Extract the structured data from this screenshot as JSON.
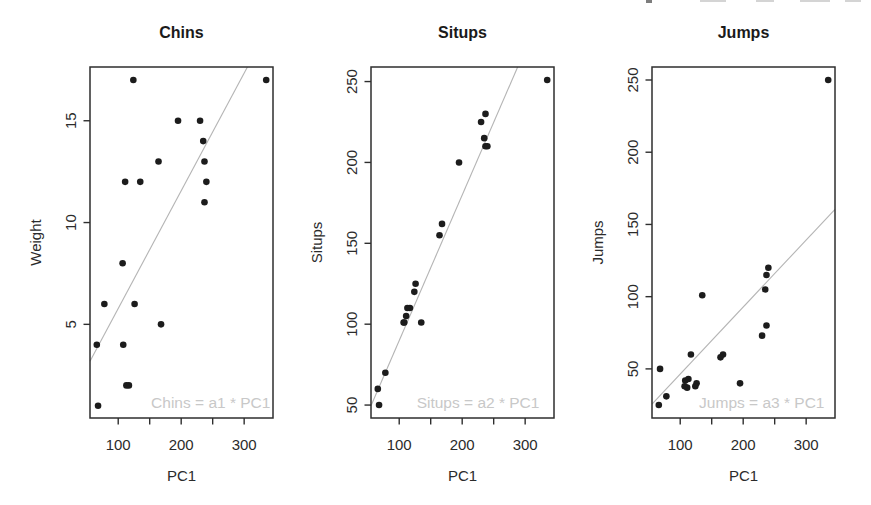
{
  "figure_background": "#ffffff",
  "colors": {
    "point": "#1c1c1c",
    "fit_line": "#b4b4b4",
    "annotation": "#c8c8c8",
    "axis": "#2e2e2e",
    "text": "#2b2b2b",
    "title": "#1a1a1a",
    "remnant_dark": "#666666",
    "remnant_light": "#b0b0b0"
  },
  "artifacts": {
    "description": "cut-off bottoms of a cropped text line at top-right edge",
    "specks": [
      {
        "left": 646,
        "width": 6,
        "height": 3,
        "tone": "dark"
      },
      {
        "left": 700,
        "width": 26,
        "height": 2,
        "tone": "light"
      },
      {
        "left": 756,
        "width": 18,
        "height": 2,
        "tone": "light"
      },
      {
        "left": 800,
        "width": 30,
        "height": 2,
        "tone": "light"
      },
      {
        "left": 845,
        "width": 16,
        "height": 2,
        "tone": "light"
      }
    ]
  },
  "chart_data": [
    {
      "type": "scatter",
      "title": "Chins",
      "xlabel": "PC1",
      "ylabel": "Weight",
      "xlim": [
        55.2,
        345.8
      ],
      "ylim": [
        0.4,
        17.64
      ],
      "grid": false,
      "xticks": [
        {
          "v": 100,
          "label": "100"
        },
        {
          "v": 150,
          "label": ""
        },
        {
          "v": 200,
          "label": "200"
        },
        {
          "v": 250,
          "label": ""
        },
        {
          "v": 300,
          "label": "300"
        }
      ],
      "yticks": [
        {
          "v": 5,
          "label": "5"
        },
        {
          "v": 10,
          "label": "10"
        },
        {
          "v": 15,
          "label": "15"
        }
      ],
      "fit_line": {
        "slope": 0.0578,
        "through_origin": true
      },
      "annotation": "Chins = a1 * PC1",
      "points": [
        [
          168,
          5
        ],
        [
          117,
          2
        ],
        [
          135,
          12
        ],
        [
          111,
          12
        ],
        [
          164,
          13
        ],
        [
          108,
          4
        ],
        [
          107,
          8
        ],
        [
          126,
          6
        ],
        [
          195,
          15
        ],
        [
          335,
          17
        ],
        [
          124,
          17
        ],
        [
          237,
          13
        ],
        [
          235,
          14
        ],
        [
          68,
          1
        ],
        [
          78,
          6
        ],
        [
          240,
          12
        ],
        [
          66,
          4
        ],
        [
          237,
          11
        ],
        [
          230,
          15
        ],
        [
          113,
          2
        ]
      ]
    },
    {
      "type": "scatter",
      "title": "Situps",
      "xlabel": "PC1",
      "ylabel": "Situps",
      "xlim": [
        55.2,
        345.8
      ],
      "ylim": [
        42,
        259
      ],
      "grid": false,
      "xticks": [
        {
          "v": 100,
          "label": "100"
        },
        {
          "v": 150,
          "label": ""
        },
        {
          "v": 200,
          "label": "200"
        },
        {
          "v": 250,
          "label": ""
        },
        {
          "v": 300,
          "label": "300"
        }
      ],
      "yticks": [
        {
          "v": 50,
          "label": "50"
        },
        {
          "v": 100,
          "label": "100"
        },
        {
          "v": 150,
          "label": "150"
        },
        {
          "v": 200,
          "label": "200"
        },
        {
          "v": 250,
          "label": "250"
        }
      ],
      "fit_line": {
        "slope": 0.899,
        "through_origin": true
      },
      "annotation": "Situps = a2 * PC1",
      "points": [
        [
          168,
          162
        ],
        [
          117,
          110
        ],
        [
          135,
          101
        ],
        [
          111,
          105
        ],
        [
          164,
          155
        ],
        [
          108,
          101
        ],
        [
          107,
          101
        ],
        [
          126,
          125
        ],
        [
          195,
          200
        ],
        [
          335,
          251
        ],
        [
          124,
          120
        ],
        [
          237,
          210
        ],
        [
          235,
          215
        ],
        [
          68,
          50
        ],
        [
          78,
          70
        ],
        [
          240,
          210
        ],
        [
          66,
          60
        ],
        [
          237,
          230
        ],
        [
          230,
          225
        ],
        [
          113,
          110
        ]
      ]
    },
    {
      "type": "scatter",
      "title": "Jumps",
      "xlabel": "PC1",
      "ylabel": "Jumps",
      "xlim": [
        55.2,
        345.8
      ],
      "ylim": [
        16,
        259
      ],
      "grid": false,
      "xticks": [
        {
          "v": 100,
          "label": "100"
        },
        {
          "v": 150,
          "label": ""
        },
        {
          "v": 200,
          "label": "200"
        },
        {
          "v": 250,
          "label": ""
        },
        {
          "v": 300,
          "label": "300"
        }
      ],
      "yticks": [
        {
          "v": 50,
          "label": "50"
        },
        {
          "v": 100,
          "label": "100"
        },
        {
          "v": 150,
          "label": "150"
        },
        {
          "v": 200,
          "label": "200"
        },
        {
          "v": 250,
          "label": "250"
        }
      ],
      "fit_line": {
        "slope": 0.464,
        "through_origin": true
      },
      "annotation": "Jumps = a3 * PC1",
      "points": [
        [
          168,
          60
        ],
        [
          117,
          60
        ],
        [
          135,
          101
        ],
        [
          111,
          37
        ],
        [
          164,
          58
        ],
        [
          108,
          42
        ],
        [
          107,
          38
        ],
        [
          126,
          40
        ],
        [
          195,
          40
        ],
        [
          335,
          250
        ],
        [
          124,
          38
        ],
        [
          237,
          115
        ],
        [
          235,
          105
        ],
        [
          68,
          50
        ],
        [
          78,
          31
        ],
        [
          240,
          120
        ],
        [
          66,
          25
        ],
        [
          237,
          80
        ],
        [
          230,
          73
        ],
        [
          113,
          43
        ]
      ]
    }
  ]
}
